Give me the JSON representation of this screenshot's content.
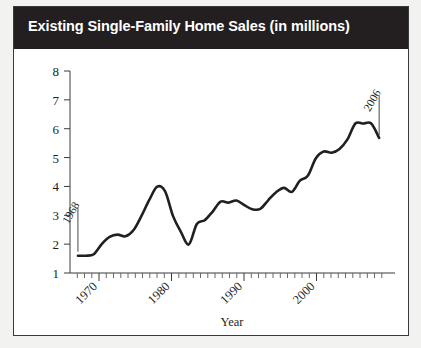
{
  "card": {
    "title": "Existing Single-Family Home Sales (in millions)"
  },
  "chart_data": {
    "type": "line",
    "title": "Existing Single-Family Home Sales (in millions)",
    "xlabel": "Year",
    "ylabel": "",
    "xlim": [
      1967,
      2008
    ],
    "ylim": [
      1,
      8
    ],
    "grid": false,
    "legend": "none",
    "yticks": [
      "8",
      "7",
      "6",
      "5",
      "4",
      "3",
      "2",
      "1"
    ],
    "xticks": [
      "1970",
      "1980",
      "1990",
      "2000"
    ],
    "xtick_values": [
      1970,
      1980,
      1990,
      2000
    ],
    "minor_tick_step": 1,
    "annotations": [
      {
        "label": "1968",
        "x": 1968,
        "y": 1.6
      },
      {
        "label": "2006",
        "x": 2006,
        "y": 5.7
      }
    ],
    "x": [
      1968,
      1969,
      1970,
      1971,
      1972,
      1973,
      1974,
      1975,
      1976,
      1977,
      1978,
      1979,
      1980,
      1981,
      1982,
      1983,
      1984,
      1985,
      1986,
      1987,
      1988,
      1989,
      1990,
      1991,
      1992,
      1993,
      1994,
      1995,
      1996,
      1997,
      1998,
      1999,
      2000,
      2001,
      2002,
      2003,
      2004,
      2005,
      2006
    ],
    "values": [
      1.6,
      1.6,
      1.65,
      2.0,
      2.25,
      2.33,
      2.27,
      2.48,
      2.97,
      3.53,
      3.99,
      3.83,
      2.97,
      2.42,
      1.99,
      2.7,
      2.83,
      3.13,
      3.47,
      3.44,
      3.51,
      3.35,
      3.21,
      3.22,
      3.52,
      3.8,
      3.95,
      3.81,
      4.2,
      4.37,
      4.97,
      5.21,
      5.17,
      5.3,
      5.63,
      6.18,
      6.18,
      6.18,
      5.68
    ],
    "annotation_1968_value": 1.6,
    "annotation_2006_value": 5.7
  }
}
